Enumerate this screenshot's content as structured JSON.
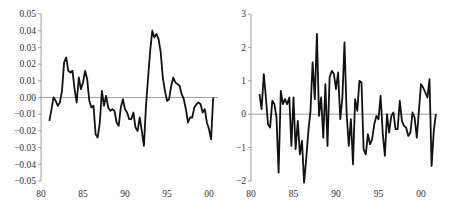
{
  "chart_data": [
    {
      "type": "line",
      "title": "",
      "xlabel": "",
      "ylabel": "",
      "xlim": [
        80,
        101
      ],
      "ylim": [
        -0.05,
        0.05
      ],
      "grid": false,
      "legend": "none",
      "xticks": [
        80,
        85,
        90,
        95,
        100
      ],
      "xtick_labels": [
        "80",
        "85",
        "90",
        "95",
        "00"
      ],
      "yticks": [
        0.05,
        0.04,
        0.03,
        0.02,
        0.01,
        0.0,
        -0.01,
        -0.02,
        -0.03,
        -0.04,
        -0.05
      ],
      "ytick_labels": [
        "0.05",
        "0.04",
        "0.03",
        "0.02",
        "0.01",
        "0.00",
        "−0.01",
        "−0.02",
        "−0.03",
        "−0.04",
        "−0.05"
      ],
      "zero_line": true,
      "series": [
        {
          "name": "series-left",
          "x": [
            81.0,
            81.25,
            81.5,
            81.75,
            82.0,
            82.25,
            82.5,
            82.75,
            83.0,
            83.25,
            83.5,
            83.75,
            84.0,
            84.25,
            84.5,
            84.75,
            85.0,
            85.25,
            85.5,
            85.75,
            86.0,
            86.25,
            86.5,
            86.75,
            87.0,
            87.25,
            87.5,
            87.75,
            88.0,
            88.25,
            88.5,
            88.75,
            89.0,
            89.25,
            89.5,
            89.75,
            90.0,
            90.25,
            90.5,
            90.75,
            91.0,
            91.25,
            91.5,
            91.75,
            92.0,
            92.25,
            92.5,
            92.75,
            93.0,
            93.25,
            93.5,
            93.75,
            94.0,
            94.25,
            94.5,
            94.75,
            95.0,
            95.25,
            95.5,
            95.75,
            96.0,
            96.25,
            96.5,
            96.75,
            97.0,
            97.25,
            97.5,
            97.75,
            98.0,
            98.25,
            98.5,
            98.75,
            99.0,
            99.25,
            99.5,
            99.75,
            100.0,
            100.25,
            100.5
          ],
          "values": [
            -0.014,
            -0.007,
            0.0,
            -0.002,
            -0.005,
            -0.003,
            0.004,
            0.021,
            0.024,
            0.016,
            0.015,
            0.016,
            0.005,
            -0.003,
            0.012,
            0.005,
            0.009,
            0.016,
            0.011,
            -0.002,
            -0.006,
            -0.005,
            -0.022,
            -0.024,
            -0.015,
            0.004,
            -0.005,
            0.001,
            -0.006,
            -0.008,
            -0.007,
            -0.008,
            -0.015,
            -0.017,
            -0.006,
            -0.001,
            -0.007,
            -0.009,
            -0.013,
            -0.013,
            -0.009,
            -0.018,
            -0.02,
            -0.012,
            -0.02,
            -0.029,
            -0.005,
            0.012,
            0.028,
            0.04,
            0.036,
            0.038,
            0.035,
            0.027,
            0.012,
            0.004,
            -0.002,
            -0.001,
            0.007,
            0.012,
            0.009,
            0.008,
            0.007,
            0.002,
            -0.001,
            -0.007,
            -0.015,
            -0.012,
            -0.012,
            -0.006,
            -0.004,
            -0.003,
            -0.004,
            -0.009,
            -0.007,
            -0.015,
            -0.019,
            -0.025,
            0.0
          ]
        }
      ]
    },
    {
      "type": "line",
      "title": "",
      "xlabel": "",
      "ylabel": "",
      "xlim": [
        80,
        102
      ],
      "ylim": [
        -2,
        3
      ],
      "grid": false,
      "legend": "none",
      "xticks": [
        80,
        85,
        90,
        95,
        100
      ],
      "xtick_labels": [
        "80",
        "85",
        "90",
        "95",
        "00"
      ],
      "yticks": [
        3,
        2,
        1,
        0,
        -1,
        -2
      ],
      "ytick_labels": [
        "3",
        "2",
        "1",
        "0",
        "−1",
        "−2"
      ],
      "zero_line": true,
      "series": [
        {
          "name": "series-right",
          "x": [
            81.0,
            81.25,
            81.5,
            81.75,
            82.0,
            82.25,
            82.5,
            82.75,
            83.0,
            83.25,
            83.5,
            83.75,
            84.0,
            84.25,
            84.5,
            84.75,
            85.0,
            85.25,
            85.5,
            85.75,
            86.0,
            86.25,
            86.5,
            86.75,
            87.0,
            87.25,
            87.5,
            87.75,
            88.0,
            88.25,
            88.5,
            88.75,
            89.0,
            89.25,
            89.5,
            89.75,
            90.0,
            90.25,
            90.5,
            90.75,
            91.0,
            91.25,
            91.5,
            91.75,
            92.0,
            92.25,
            92.5,
            92.75,
            93.0,
            93.25,
            93.5,
            93.75,
            94.0,
            94.25,
            94.5,
            94.75,
            95.0,
            95.25,
            95.5,
            95.75,
            96.0,
            96.25,
            96.5,
            96.75,
            97.0,
            97.25,
            97.5,
            97.75,
            98.0,
            98.25,
            98.5,
            98.75,
            99.0,
            99.25,
            99.5,
            99.75,
            100.0,
            100.25,
            100.5,
            100.75,
            101.0,
            101.25,
            101.5,
            101.75
          ],
          "values": [
            0.6,
            0.15,
            1.2,
            0.5,
            -0.3,
            -0.4,
            0.4,
            0.3,
            -0.1,
            -1.75,
            0.7,
            0.3,
            0.45,
            0.3,
            0.5,
            -0.95,
            0.5,
            -1.05,
            -0.2,
            -1.2,
            -0.8,
            -2.05,
            -1.3,
            -0.5,
            0.1,
            1.55,
            0.45,
            2.4,
            -0.05,
            0.5,
            -0.7,
            0.9,
            -0.95,
            1.1,
            1.3,
            1.2,
            0.75,
            1.25,
            -0.15,
            0.5,
            2.15,
            0.05,
            -0.95,
            -0.15,
            -1.5,
            0.45,
            0.1,
            1.0,
            0.95,
            -1.05,
            -1.2,
            -0.6,
            -0.9,
            -0.75,
            -0.3,
            -0.05,
            -0.15,
            0.55,
            -0.6,
            -1.25,
            0.0,
            -0.55,
            -0.05,
            0.05,
            -0.45,
            -0.45,
            0.4,
            -0.2,
            -0.35,
            -0.4,
            -0.65,
            -0.55,
            0.05,
            -0.1,
            -0.7,
            0.1,
            0.9,
            0.8,
            0.65,
            0.5,
            1.05,
            -1.55,
            -0.5,
            0.0
          ]
        }
      ]
    }
  ]
}
